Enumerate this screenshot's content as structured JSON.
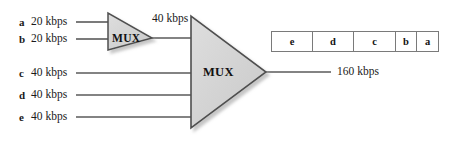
{
  "diagram": {
    "inputs": [
      {
        "id": "a",
        "rate": "20 kbps"
      },
      {
        "id": "b",
        "rate": "20 kbps"
      },
      {
        "id": "c",
        "rate": "40 kbps"
      },
      {
        "id": "d",
        "rate": "40 kbps"
      },
      {
        "id": "e",
        "rate": "40 kbps"
      }
    ],
    "mux1": {
      "label": "MUX",
      "output_rate": "40 kbps"
    },
    "mux2": {
      "label": "MUX",
      "output_rate": "160 kbps"
    },
    "frame": {
      "slots": [
        {
          "label": "e",
          "width": 41
        },
        {
          "label": "d",
          "width": 41
        },
        {
          "label": "c",
          "width": 42
        },
        {
          "label": "b",
          "width": 21
        },
        {
          "label": "a",
          "width": 21
        }
      ]
    },
    "colors": {
      "shape_fill": "#d4d4d4",
      "shape_stroke": "#555555",
      "line": "#5a5a5a",
      "text": "#1a1a1a",
      "frame_border": "#7a7a7a",
      "background": "#ffffff"
    }
  }
}
